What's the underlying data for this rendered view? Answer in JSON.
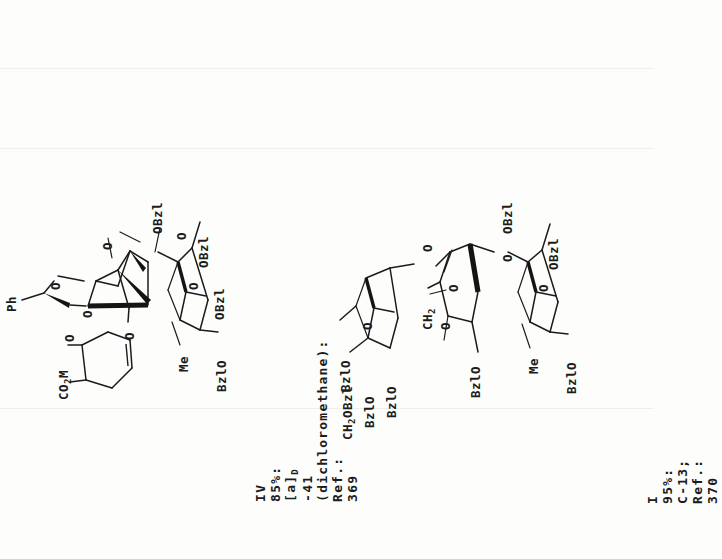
{
  "page": {
    "background_hex": "#fdfdfc",
    "ink_hex": "#1b1b1b",
    "orientation": "text rotated 90 degrees counter-clockwise (reads bottom-to-top)"
  },
  "entries": [
    {
      "id": "entry-iv",
      "number": "IV",
      "yield": "85%:",
      "rotation_label": "[a]",
      "rotation_sub": "D",
      "rotation_value": "-41",
      "solvent": "(dichloromethane):",
      "ref_label": "Ref.:",
      "ref_number": "369",
      "caption_full": "IV  85%:  [a]D -41 (dichloromethane):  Ref.: 369",
      "structure_labels": [
        "Ph",
        "O",
        "O",
        "O",
        "O",
        "CO2M",
        "OBzl",
        "OBzl",
        "O",
        "O",
        "Me",
        "OBzl",
        "BzlO"
      ]
    },
    {
      "id": "entry-i",
      "number": "I",
      "yield": "95%:",
      "nmr": "C-13;",
      "ref_label": "Ref.:",
      "ref_number": "370",
      "caption_full": "I  95%:  C-13; Ref.: 370",
      "structure_labels": [
        "CH2OBzl",
        "BzlO",
        "BzlO",
        "BzlO",
        "O",
        "CH2",
        "O",
        "O",
        "O",
        "O",
        "BzlO",
        "OBzl",
        "O",
        "Me",
        "OBzl",
        "BzlO"
      ]
    }
  ],
  "labels": {
    "Ph": "Ph",
    "O": "O",
    "Me": "Me",
    "OBzl": "OBzl",
    "BzlO": "BzlO",
    "CO2M_main": "CO",
    "CO2M_sub": "2",
    "CO2M_tail": "M",
    "CH2OBzl_main": "CH",
    "CH2OBzl_sub": "2",
    "CH2OBzl_tail": "OBzl",
    "CH2_main": "CH",
    "CH2_sub": "2"
  }
}
